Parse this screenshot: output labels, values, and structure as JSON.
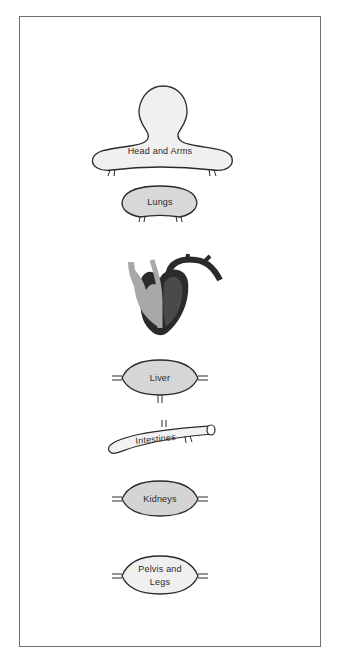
{
  "diagram": {
    "type": "circulatory-system-schematic",
    "colors": {
      "frame": "#6f6f6f",
      "organ_fill_light": "#efefef",
      "organ_fill_medium": "#d6d6d6",
      "organ_outline": "#2a2a2a",
      "heart_dark": "#2b2b2b",
      "heart_mid": "#4a4a4a",
      "heart_light": "#a8a8a8"
    },
    "organs": [
      {
        "id": "head-arms",
        "label": "Head and Arms"
      },
      {
        "id": "lungs",
        "label": "Lungs"
      },
      {
        "id": "heart",
        "label": ""
      },
      {
        "id": "liver",
        "label": "Liver"
      },
      {
        "id": "intestines",
        "label": "Intestines"
      },
      {
        "id": "kidneys",
        "label": "Kidneys"
      },
      {
        "id": "pelvis-legs",
        "label_line1": "Pelvis and",
        "label_line2": "Legs"
      }
    ]
  }
}
